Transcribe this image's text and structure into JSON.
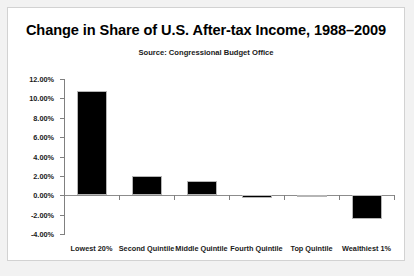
{
  "chart_data": {
    "type": "bar",
    "title": "Change in Share of U.S. After-tax Income, 1988–2009",
    "subtitle": "Source: Congressional Budget Office",
    "xlabel": "",
    "ylabel": "",
    "categories": [
      "Lowest 20%",
      "Second Quintile",
      "Middle Quintile",
      "Fourth Quintile",
      "Top Quintile",
      "Wealthiest 1%"
    ],
    "values": [
      10.75,
      1.95,
      1.45,
      -0.3,
      -0.15,
      -2.4
    ],
    "value_labels": [
      "10.75%",
      "1.95%",
      "1.45%",
      "-0.30%",
      "-0.15%",
      "-2.40%"
    ],
    "ylim": [
      -4,
      12
    ],
    "ytick_values": [
      12,
      10,
      8,
      6,
      4,
      2,
      0,
      -2,
      -4
    ],
    "ytick_labels": [
      "12.00%",
      "10.00%",
      "8.00%",
      "6.00%",
      "4.00%",
      "2.00%",
      "0.00%",
      "-2.00%",
      "-4.00%"
    ],
    "grid": false,
    "legend": false,
    "bar_color": "#000000",
    "axis_color": "#808080",
    "background_color": "#ffffff",
    "page_background_color": "#f2f2f2"
  }
}
